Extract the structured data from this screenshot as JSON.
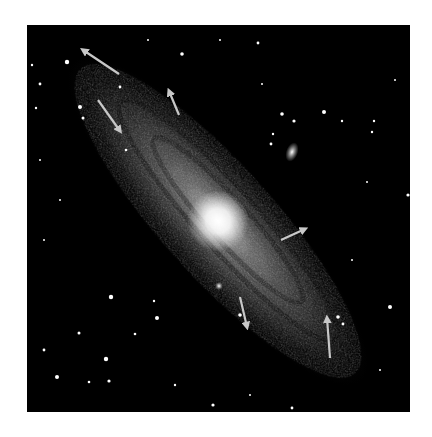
{
  "image": {
    "subject": "Spiral galaxy with companion galaxies and annotation arrows",
    "frame": {
      "x": 27,
      "y": 25,
      "width": 383,
      "height": 387,
      "background": "#000000"
    },
    "page_background": "#ffffff"
  },
  "colors": {
    "arrow": "#c8c8c8",
    "star": "#ffffff",
    "galaxy_core": "#ffffff",
    "galaxy_disk": "#9a9a9a"
  },
  "galaxy": {
    "core": {
      "cx": 218,
      "cy": 221,
      "r": 14
    },
    "angle_deg": 48,
    "disk_layers": [
      {
        "rx": 215,
        "ry": 58,
        "opacity": 0.16
      },
      {
        "rx": 185,
        "ry": 48,
        "opacity": 0.22
      },
      {
        "rx": 140,
        "ry": 36,
        "opacity": 0.26
      },
      {
        "rx": 95,
        "ry": 26,
        "opacity": 0.32
      },
      {
        "rx": 55,
        "ry": 18,
        "opacity": 0.5
      },
      {
        "rx": 30,
        "ry": 12,
        "opacity": 0.7
      }
    ],
    "dust_lanes": [
      {
        "rx": 160,
        "ry": 30,
        "opacity": 0.35
      },
      {
        "rx": 110,
        "ry": 20,
        "opacity": 0.3
      }
    ]
  },
  "companions": [
    {
      "name": "companion-galaxy-upper-right",
      "cx": 292,
      "cy": 152,
      "rx": 6,
      "ry": 10,
      "angle_deg": 20
    },
    {
      "name": "companion-galaxy-lower",
      "cx": 219,
      "cy": 286,
      "rx": 4,
      "ry": 4,
      "angle_deg": 0
    }
  ],
  "arrows": [
    {
      "id": "arrow-1",
      "x1": 119,
      "y1": 74,
      "x2": 83,
      "y2": 50
    },
    {
      "id": "arrow-2",
      "x1": 98,
      "y1": 100,
      "x2": 120,
      "y2": 131
    },
    {
      "id": "arrow-3",
      "x1": 179,
      "y1": 115,
      "x2": 169,
      "y2": 91
    },
    {
      "id": "arrow-4",
      "x1": 281,
      "y1": 240,
      "x2": 305,
      "y2": 229
    },
    {
      "id": "arrow-5",
      "x1": 240,
      "y1": 297,
      "x2": 247,
      "y2": 327
    },
    {
      "id": "arrow-6",
      "x1": 330,
      "y1": 358,
      "x2": 327,
      "y2": 318
    }
  ],
  "stars": [
    {
      "x": 67,
      "y": 62,
      "r": 2.2
    },
    {
      "x": 182,
      "y": 54,
      "r": 1.8
    },
    {
      "x": 40,
      "y": 84,
      "r": 1.4
    },
    {
      "x": 32,
      "y": 65,
      "r": 1.2
    },
    {
      "x": 120,
      "y": 87,
      "r": 1.4
    },
    {
      "x": 80,
      "y": 107,
      "r": 2.0
    },
    {
      "x": 83,
      "y": 118,
      "r": 1.5
    },
    {
      "x": 36,
      "y": 108,
      "r": 1.2
    },
    {
      "x": 258,
      "y": 43,
      "r": 1.4
    },
    {
      "x": 282,
      "y": 114,
      "r": 1.8
    },
    {
      "x": 294,
      "y": 121,
      "r": 1.6
    },
    {
      "x": 324,
      "y": 112,
      "r": 2.0
    },
    {
      "x": 271,
      "y": 144,
      "r": 1.4
    },
    {
      "x": 273,
      "y": 134,
      "r": 1.2
    },
    {
      "x": 342,
      "y": 121,
      "r": 1.2
    },
    {
      "x": 374,
      "y": 121,
      "r": 1.2
    },
    {
      "x": 372,
      "y": 132,
      "r": 1.2
    },
    {
      "x": 408,
      "y": 195,
      "r": 1.6
    },
    {
      "x": 262,
      "y": 84,
      "r": 1.0
    },
    {
      "x": 367,
      "y": 182,
      "r": 1.0
    },
    {
      "x": 352,
      "y": 260,
      "r": 1.0
    },
    {
      "x": 111,
      "y": 297,
      "r": 2.2
    },
    {
      "x": 157,
      "y": 318,
      "r": 2.0
    },
    {
      "x": 106,
      "y": 359,
      "r": 2.2
    },
    {
      "x": 79,
      "y": 333,
      "r": 1.5
    },
    {
      "x": 57,
      "y": 377,
      "r": 2.0
    },
    {
      "x": 109,
      "y": 381,
      "r": 1.6
    },
    {
      "x": 44,
      "y": 350,
      "r": 1.4
    },
    {
      "x": 135,
      "y": 334,
      "r": 1.3
    },
    {
      "x": 89,
      "y": 382,
      "r": 1.3
    },
    {
      "x": 154,
      "y": 301,
      "r": 1.2
    },
    {
      "x": 390,
      "y": 307,
      "r": 2.0
    },
    {
      "x": 338,
      "y": 317,
      "r": 1.8
    },
    {
      "x": 343,
      "y": 324,
      "r": 1.4
    },
    {
      "x": 213,
      "y": 405,
      "r": 1.6
    },
    {
      "x": 292,
      "y": 408,
      "r": 1.4
    },
    {
      "x": 44,
      "y": 240,
      "r": 1.0
    },
    {
      "x": 60,
      "y": 200,
      "r": 1.0
    },
    {
      "x": 126,
      "y": 150,
      "r": 1.3
    },
    {
      "x": 40,
      "y": 160,
      "r": 1.0
    },
    {
      "x": 175,
      "y": 385,
      "r": 1.2
    },
    {
      "x": 250,
      "y": 395,
      "r": 1.0
    },
    {
      "x": 395,
      "y": 80,
      "r": 1.0
    },
    {
      "x": 220,
      "y": 40,
      "r": 1.0
    },
    {
      "x": 148,
      "y": 40,
      "r": 1.0
    },
    {
      "x": 380,
      "y": 370,
      "r": 1.0
    },
    {
      "x": 240,
      "y": 315,
      "r": 1.8
    }
  ]
}
